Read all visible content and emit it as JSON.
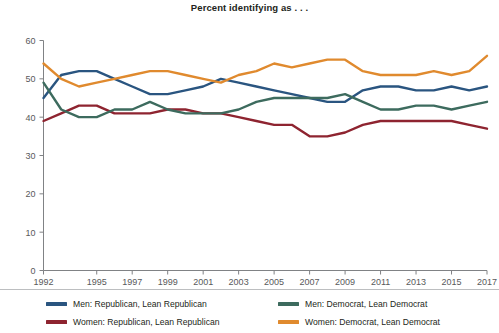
{
  "chart_data": {
    "type": "line",
    "title": "Percent identifying as . . .",
    "xlabel": "",
    "ylabel": "",
    "ylim": [
      0,
      60
    ],
    "xlim": [
      1992,
      2017
    ],
    "yticks": [
      0,
      10,
      20,
      30,
      40,
      50,
      60
    ],
    "xticks": [
      1992,
      1995,
      1997,
      1999,
      2001,
      2003,
      2005,
      2007,
      2009,
      2011,
      2013,
      2015,
      2017
    ],
    "grid": false,
    "legend_position": "bottom",
    "x": [
      1992,
      1993,
      1994,
      1995,
      1996,
      1997,
      1998,
      1999,
      2000,
      2001,
      2002,
      2003,
      2004,
      2005,
      2006,
      2007,
      2008,
      2009,
      2010,
      2011,
      2012,
      2013,
      2014,
      2015,
      2016,
      2017
    ],
    "series": [
      {
        "name": "Men: Republican, Lean Republican",
        "color": "#2a5580",
        "values": [
          45,
          51,
          52,
          52,
          50,
          48,
          46,
          46,
          47,
          48,
          50,
          49,
          48,
          47,
          46,
          45,
          44,
          44,
          47,
          48,
          48,
          47,
          47,
          48,
          47,
          48
        ]
      },
      {
        "name": "Women: Republican, Lean Republican",
        "color": "#8e2430",
        "values": [
          39,
          41,
          43,
          43,
          41,
          41,
          41,
          42,
          42,
          41,
          41,
          40,
          39,
          38,
          38,
          35,
          35,
          36,
          38,
          39,
          39,
          39,
          39,
          39,
          38,
          37
        ]
      },
      {
        "name": "Men: Democrat, Lean Democrat",
        "color": "#3d6b5e",
        "values": [
          49,
          42,
          40,
          40,
          42,
          42,
          44,
          42,
          41,
          41,
          41,
          42,
          44,
          45,
          45,
          45,
          45,
          46,
          44,
          42,
          42,
          43,
          43,
          42,
          43,
          44
        ]
      },
      {
        "name": "Women: Democrat, Lean Democrat",
        "color": "#e08a2e",
        "values": [
          54,
          50,
          48,
          49,
          50,
          51,
          52,
          52,
          51,
          50,
          49,
          51,
          52,
          54,
          53,
          54,
          55,
          55,
          52,
          51,
          51,
          51,
          52,
          51,
          52,
          56
        ]
      }
    ]
  },
  "legend": {
    "items": [
      {
        "label": "Men: Republican, Lean Republican",
        "color": "#2a5580"
      },
      {
        "label": "Men: Democrat, Lean Democrat",
        "color": "#3d6b5e"
      },
      {
        "label": "Women: Republican, Lean Republican",
        "color": "#8e2430"
      },
      {
        "label": "Women: Democrat, Lean Democrat",
        "color": "#e08a2e"
      }
    ]
  },
  "axis": {
    "color": "#808285",
    "tick_label_color": "#58595b"
  }
}
